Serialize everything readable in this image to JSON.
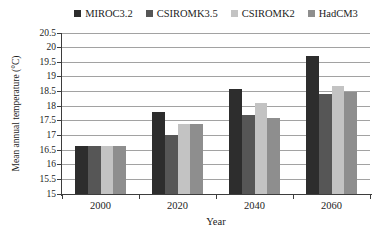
{
  "chart_data": {
    "type": "bar",
    "categories": [
      "2000",
      "2020",
      "2040",
      "2060"
    ],
    "series": [
      {
        "name": "MIROC3.2",
        "color": "#2d2d2d",
        "values": [
          16.65,
          17.8,
          18.6,
          19.7
        ]
      },
      {
        "name": "CSIROMK3.5",
        "color": "#565656",
        "values": [
          16.65,
          17.0,
          17.7,
          18.4
        ]
      },
      {
        "name": "CSIROMK2",
        "color": "#c3c3c3",
        "values": [
          16.65,
          17.4,
          18.1,
          18.7
        ]
      },
      {
        "name": "HadCM3",
        "color": "#8e8e8e",
        "values": [
          16.65,
          17.4,
          17.6,
          18.5
        ]
      }
    ],
    "title": "",
    "xlabel": "Year",
    "ylabel": "Mean annual temperature (°C)",
    "ylim": [
      15,
      20.5
    ],
    "ytick_step": 0.5,
    "grid": true,
    "legend_position": "top",
    "colors": {
      "gridline": "#a2a2a2",
      "axis": "#3d3d3d",
      "text": "#1c1c1c",
      "background": "#ffffff"
    }
  }
}
